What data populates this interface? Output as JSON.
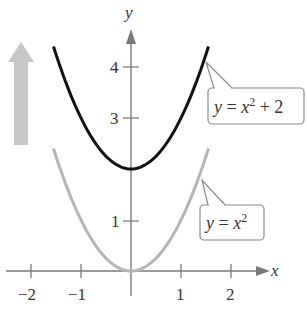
{
  "chart_data": {
    "type": "line",
    "title": "",
    "xlabel": "x",
    "ylabel": "y",
    "xlim": [
      -2.5,
      3.0
    ],
    "ylim": [
      -0.5,
      4.8
    ],
    "x_ticks": [
      "-2",
      "-1",
      "1",
      "2"
    ],
    "y_ticks": [
      "1",
      "3",
      "4"
    ],
    "grid": false,
    "series": [
      {
        "name": "y = x^2 + 2",
        "color": "#111111",
        "formula": "x^2 + 2",
        "x_range": [
          -1.55,
          1.55
        ],
        "vertex": [
          0,
          2
        ]
      },
      {
        "name": "y = x^2",
        "color": "#b5b5b5",
        "formula": "x^2",
        "x_range": [
          -1.55,
          1.55
        ],
        "vertex": [
          0,
          0
        ]
      }
    ],
    "annotations": [
      {
        "type": "arrow",
        "direction": "up",
        "color": "#c4c4c4",
        "meaning": "vertical shift upward"
      },
      {
        "type": "callout",
        "text": "y = x² + 2",
        "points_to": "upper curve"
      },
      {
        "type": "callout",
        "text": "y = x²",
        "points_to": "lower curve"
      }
    ]
  },
  "axes": {
    "x_label": "x",
    "y_label": "y",
    "x_tick_labels": [
      "−2",
      "−1",
      "1",
      "2"
    ],
    "y_tick_labels": [
      "1",
      "3",
      "4"
    ]
  },
  "callouts": {
    "upper": {
      "y": "y",
      "eq": " = ",
      "x": "x",
      "exp": "2",
      "rest": " + 2"
    },
    "lower": {
      "y": "y",
      "eq": " = ",
      "x": "x",
      "exp": "2"
    }
  },
  "colors": {
    "axis": "#7a7a7a",
    "upper_curve": "#111111",
    "lower_curve": "#b5b5b5",
    "shift_arrow": "#c6c6c6"
  }
}
